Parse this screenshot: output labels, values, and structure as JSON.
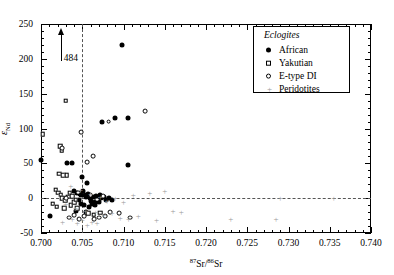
{
  "chart_data": {
    "type": "scatter",
    "title": "",
    "xlabel": "87Sr/86Sr",
    "ylabel": "eNd",
    "xlabel_parts": {
      "sup1": "87",
      "el1": "Sr/",
      "sup2": "86",
      "el2": "Sr"
    },
    "ylabel_parts": {
      "symbol": "ε",
      "sub": "Nd"
    },
    "xlim": [
      0.7,
      0.74
    ],
    "ylim": [
      -50,
      250
    ],
    "xticks": [
      0.7,
      0.705,
      0.71,
      0.715,
      0.72,
      0.725,
      0.73,
      0.735,
      0.74
    ],
    "xtick_labels": [
      "0.700",
      "0.705",
      "0.710",
      "0.715",
      "0.720",
      "0.725",
      "0.730",
      "0.735",
      "0.740"
    ],
    "yticks": [
      -50,
      0,
      50,
      100,
      150,
      200,
      250
    ],
    "ytick_labels": [
      "-50",
      "0",
      "50",
      "100",
      "150",
      "200",
      "250"
    ],
    "x_minor_per_major": 5,
    "y_minor_per_major": 5,
    "grid": false,
    "legend_position": "top-right",
    "reference_lines": [
      {
        "name": "bulk-earth-sr",
        "orientation": "vertical",
        "value": 0.705,
        "style": "dashed"
      },
      {
        "name": "chur-nd",
        "orientation": "horizontal",
        "value": 0,
        "style": "dashed"
      }
    ],
    "annotations": [
      {
        "name": "off-scale-484",
        "text": "484",
        "x": 0.7025,
        "y": 200,
        "arrow": "up",
        "note": "point plots off scale at eNd = 484"
      }
    ],
    "series": [
      {
        "name": "African",
        "marker": "filled-circle",
        "color": "#000000",
        "points": [
          [
            0.7098,
            220
          ],
          [
            0.7074,
            110
          ],
          [
            0.709,
            115
          ],
          [
            0.7106,
            115
          ],
          [
            0.7,
            55
          ],
          [
            0.7031,
            50
          ],
          [
            0.7037,
            50
          ],
          [
            0.7105,
            48
          ],
          [
            0.705,
            30
          ],
          [
            0.7056,
            22
          ],
          [
            0.704,
            10
          ],
          [
            0.7044,
            8
          ],
          [
            0.7047,
            6
          ],
          [
            0.7049,
            4
          ],
          [
            0.7051,
            10
          ],
          [
            0.7053,
            5
          ],
          [
            0.7055,
            2
          ],
          [
            0.7057,
            6
          ],
          [
            0.7059,
            0
          ],
          [
            0.7061,
            -4
          ],
          [
            0.7063,
            2
          ],
          [
            0.7065,
            -6
          ],
          [
            0.7067,
            3
          ],
          [
            0.7069,
            -2
          ],
          [
            0.7071,
            5
          ],
          [
            0.7073,
            0
          ],
          [
            0.7046,
            -2
          ],
          [
            0.7048,
            -8
          ],
          [
            0.7052,
            -10
          ],
          [
            0.7058,
            -12
          ],
          [
            0.7062,
            -8
          ],
          [
            0.7066,
            -10
          ],
          [
            0.707,
            -6
          ],
          [
            0.7076,
            1
          ],
          [
            0.7079,
            -3
          ],
          [
            0.7082,
            0
          ],
          [
            0.7086,
            -2
          ],
          [
            0.7011,
            -25
          ],
          [
            0.7043,
            -18
          ],
          [
            0.7054,
            -20
          ]
        ]
      },
      {
        "name": "Yakutian",
        "marker": "open-square",
        "color": "#000000",
        "points": [
          [
            0.703,
            140
          ],
          [
            0.7002,
            92
          ],
          [
            0.7023,
            75
          ],
          [
            0.7025,
            68
          ],
          [
            0.7022,
            35
          ],
          [
            0.7027,
            33
          ],
          [
            0.7031,
            33
          ],
          [
            0.7018,
            12
          ],
          [
            0.7021,
            8
          ],
          [
            0.7024,
            5
          ],
          [
            0.7026,
            0
          ],
          [
            0.7029,
            -3
          ],
          [
            0.7033,
            2
          ],
          [
            0.7014,
            -8
          ],
          [
            0.7019,
            -12
          ],
          [
            0.7028,
            -14
          ],
          [
            0.7036,
            -10
          ],
          [
            0.704,
            -6
          ],
          [
            0.7044,
            -14
          ],
          [
            0.7035,
            8
          ],
          [
            0.7038,
            3
          ],
          [
            0.7042,
            -2
          ],
          [
            0.7057,
            -22
          ],
          [
            0.7064,
            -24
          ],
          [
            0.7072,
            -21
          ]
        ]
      },
      {
        "name": "E-type DI",
        "marker": "open-circle",
        "color": "#000000",
        "points": [
          [
            0.7049,
            95
          ],
          [
            0.7082,
            110
          ],
          [
            0.7126,
            125
          ],
          [
            0.7026,
            72
          ],
          [
            0.7063,
            60
          ],
          [
            0.7056,
            52
          ],
          [
            0.703,
            0
          ],
          [
            0.7045,
            8
          ],
          [
            0.706,
            4
          ],
          [
            0.7068,
            -2
          ],
          [
            0.7075,
            3
          ],
          [
            0.7084,
            -20
          ],
          [
            0.7095,
            -22
          ],
          [
            0.7108,
            -28
          ],
          [
            0.7064,
            -30
          ],
          [
            0.707,
            -28
          ],
          [
            0.7078,
            -26
          ],
          [
            0.7052,
            -26
          ],
          [
            0.7046,
            -30
          ],
          [
            0.704,
            -24
          ],
          [
            0.7034,
            -28
          ]
        ]
      },
      {
        "name": "Peridotites",
        "marker": "gray-plus",
        "color": "#9a9a9a",
        "points": [
          [
            0.7036,
            18
          ],
          [
            0.7048,
            12
          ],
          [
            0.706,
            6
          ],
          [
            0.7072,
            2
          ],
          [
            0.708,
            -4
          ],
          [
            0.709,
            0
          ],
          [
            0.71,
            -6
          ],
          [
            0.7112,
            4
          ],
          [
            0.7132,
            8
          ],
          [
            0.715,
            10
          ],
          [
            0.729,
            0
          ],
          [
            0.7355,
            0
          ],
          [
            0.703,
            -8
          ],
          [
            0.7042,
            -14
          ],
          [
            0.7054,
            -18
          ],
          [
            0.7066,
            -20
          ],
          [
            0.7076,
            -24
          ],
          [
            0.7086,
            -22
          ],
          [
            0.7096,
            -28
          ],
          [
            0.7106,
            -30
          ],
          [
            0.7118,
            -26
          ],
          [
            0.716,
            -18
          ],
          [
            0.717,
            -20
          ],
          [
            0.723,
            -30
          ],
          [
            0.7285,
            -30
          ],
          [
            0.714,
            -32
          ],
          [
            0.7062,
            -34
          ],
          [
            0.705,
            -32
          ],
          [
            0.7038,
            -30
          ],
          [
            0.7026,
            -34
          ],
          [
            0.7044,
            -36
          ],
          [
            0.7056,
            -38
          ],
          [
            0.7068,
            -36
          ]
        ]
      }
    ]
  },
  "legend": {
    "title": "Eclogites",
    "items": [
      {
        "label": "African",
        "marker": "filled-circle"
      },
      {
        "label": "Yakutian",
        "marker": "open-square"
      },
      {
        "label": "E-type DI",
        "marker": "open-circle"
      },
      {
        "label": "Peridotites",
        "marker": "gray-plus"
      }
    ]
  }
}
